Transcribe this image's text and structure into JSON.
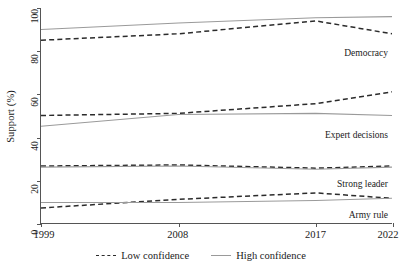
{
  "chart_data": {
    "type": "line",
    "title": "",
    "xlabel": "",
    "ylabel": "Support (%)",
    "xlim": [
      1999,
      2022
    ],
    "ylim": [
      0,
      100
    ],
    "grid": false,
    "legend_position": "bottom-center",
    "x": [
      1999,
      2008,
      2017,
      2022
    ],
    "xtick_labels": [
      "1999",
      "2008",
      "2017",
      "2022"
    ],
    "ytick_labels": [
      "0",
      "20",
      "40",
      "60",
      "80",
      "100"
    ],
    "ytick_values": [
      0,
      20,
      40,
      60,
      80,
      100
    ],
    "legend": [
      {
        "label": "Low confidence",
        "style": "dashed",
        "color": "#2b2b2b"
      },
      {
        "label": "High confidence",
        "style": "solid",
        "color": "#9a9a9a"
      }
    ],
    "groups": [
      {
        "name": "Democracy",
        "annotation": "Democracy",
        "series": [
          {
            "name": "Low confidence",
            "style": "dashed",
            "color": "#2b2b2b",
            "values": [
              85,
              88,
              94,
              88
            ]
          },
          {
            "name": "High confidence",
            "style": "solid",
            "color": "#9a9a9a",
            "values": [
              90,
              93,
              95.5,
              96
            ]
          }
        ]
      },
      {
        "name": "Expert decisions",
        "annotation": "Expert decisions",
        "series": [
          {
            "name": "Low confidence",
            "style": "dashed",
            "color": "#2b2b2b",
            "values": [
              50,
              51,
              55.5,
              61
            ]
          },
          {
            "name": "High confidence",
            "style": "solid",
            "color": "#9a9a9a",
            "values": [
              45,
              50.5,
              51,
              50
            ]
          }
        ]
      },
      {
        "name": "Strong leader",
        "annotation": "Strong leader",
        "series": [
          {
            "name": "Low confidence",
            "style": "dashed",
            "color": "#2b2b2b",
            "values": [
              26.5,
              27,
              25.5,
              26.5
            ]
          },
          {
            "name": "High confidence",
            "style": "solid",
            "color": "#9a9a9a",
            "values": [
              26,
              26.5,
              25,
              26
            ]
          }
        ]
      },
      {
        "name": "Army rule",
        "annotation": "Army rule",
        "series": [
          {
            "name": "Low confidence",
            "style": "dashed",
            "color": "#2b2b2b",
            "values": [
              7,
              11,
              14,
              11.5
            ]
          },
          {
            "name": "High confidence",
            "style": "solid",
            "color": "#9a9a9a",
            "values": [
              9.5,
              9.5,
              10.5,
              11.5
            ]
          }
        ]
      }
    ]
  },
  "series_labels": [
    {
      "text": "Democracy"
    },
    {
      "text": "Expert decisions"
    },
    {
      "text": "Strong leader"
    },
    {
      "text": "Army rule"
    }
  ]
}
